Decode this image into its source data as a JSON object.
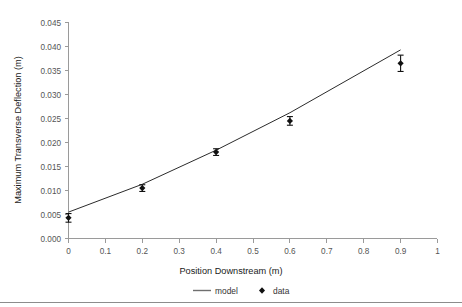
{
  "chart_data": {
    "type": "scatter",
    "title": "",
    "xlabel": "Position Downstream (m)",
    "ylabel": "Maximum Transverse Deflection (m)",
    "xlim": [
      0,
      1
    ],
    "ylim": [
      0,
      0.045
    ],
    "grid": false,
    "legend_position": "bottom",
    "xticks": [
      "0",
      "0.1",
      "0.2",
      "0.3",
      "0.4",
      "0.5",
      "0.6",
      "0.7",
      "0.8",
      "0.9",
      "1"
    ],
    "xtick_values": [
      0,
      0.1,
      0.2,
      0.3,
      0.4,
      0.5,
      0.6,
      0.7,
      0.8,
      0.9,
      1
    ],
    "yticks": [
      "0.000",
      "0.005",
      "0.010",
      "0.015",
      "0.020",
      "0.025",
      "0.030",
      "0.035",
      "0.040",
      "0.045"
    ],
    "ytick_values": [
      0,
      0.005,
      0.01,
      0.015,
      0.02,
      0.025,
      0.03,
      0.035,
      0.04,
      0.045
    ],
    "series": [
      {
        "name": "model",
        "type": "line",
        "x": [
          0,
          0.2,
          0.4,
          0.6,
          0.9
        ],
        "values": [
          0.0055,
          0.0113,
          0.0184,
          0.0262,
          0.0393
        ]
      },
      {
        "name": "data",
        "type": "scatter",
        "marker": "diamond",
        "x": [
          0,
          0.2,
          0.4,
          0.6,
          0.9
        ],
        "values": [
          0.0043,
          0.0105,
          0.018,
          0.0245,
          0.0365
        ],
        "yerr": [
          0.0009,
          0.0007,
          0.0007,
          0.0009,
          0.0017
        ]
      }
    ]
  },
  "legend": {
    "entries": [
      {
        "label": "model",
        "marker": "line",
        "color": "#6f6f6f"
      },
      {
        "label": "data",
        "marker": "diamond",
        "color": "#111111"
      }
    ]
  }
}
